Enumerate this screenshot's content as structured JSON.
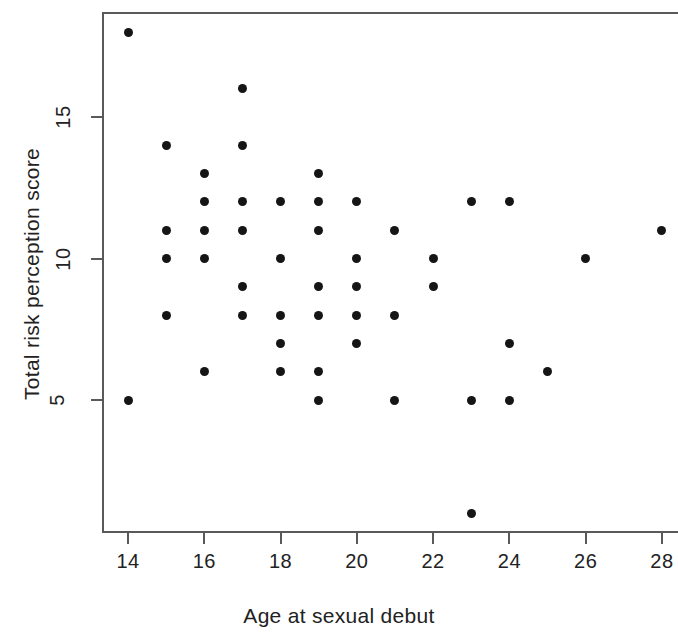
{
  "chart_data": {
    "type": "scatter",
    "title": "",
    "xlabel": "Age at sexual debut",
    "ylabel": "Total risk perception score",
    "xticks": [
      14,
      16,
      18,
      20,
      22,
      24,
      26,
      28
    ],
    "yticks": [
      5,
      10,
      15
    ],
    "xlim": [
      13.3,
      28.4
    ],
    "ylim": [
      0.4,
      18.9
    ],
    "grid": false,
    "legend": null,
    "marker": {
      "shape": "circle",
      "color": "#151515",
      "size": 9
    },
    "points": [
      {
        "x": 14,
        "y": 18
      },
      {
        "x": 14,
        "y": 5
      },
      {
        "x": 15,
        "y": 14
      },
      {
        "x": 15,
        "y": 11
      },
      {
        "x": 15,
        "y": 10
      },
      {
        "x": 15,
        "y": 8
      },
      {
        "x": 16,
        "y": 13
      },
      {
        "x": 16,
        "y": 12
      },
      {
        "x": 16,
        "y": 11
      },
      {
        "x": 16,
        "y": 10
      },
      {
        "x": 16,
        "y": 6
      },
      {
        "x": 17,
        "y": 16
      },
      {
        "x": 17,
        "y": 14
      },
      {
        "x": 17,
        "y": 12
      },
      {
        "x": 17,
        "y": 11
      },
      {
        "x": 17,
        "y": 9
      },
      {
        "x": 17,
        "y": 8
      },
      {
        "x": 18,
        "y": 12
      },
      {
        "x": 18,
        "y": 10
      },
      {
        "x": 18,
        "y": 8
      },
      {
        "x": 18,
        "y": 7
      },
      {
        "x": 18,
        "y": 6
      },
      {
        "x": 19,
        "y": 13
      },
      {
        "x": 19,
        "y": 12
      },
      {
        "x": 19,
        "y": 11
      },
      {
        "x": 19,
        "y": 9
      },
      {
        "x": 19,
        "y": 8
      },
      {
        "x": 19,
        "y": 6
      },
      {
        "x": 19,
        "y": 5
      },
      {
        "x": 20,
        "y": 12
      },
      {
        "x": 20,
        "y": 10
      },
      {
        "x": 20,
        "y": 9
      },
      {
        "x": 20,
        "y": 8
      },
      {
        "x": 20,
        "y": 7
      },
      {
        "x": 21,
        "y": 11
      },
      {
        "x": 21,
        "y": 8
      },
      {
        "x": 21,
        "y": 5
      },
      {
        "x": 22,
        "y": 10
      },
      {
        "x": 22,
        "y": 9
      },
      {
        "x": 23,
        "y": 12
      },
      {
        "x": 23,
        "y": 5
      },
      {
        "x": 23,
        "y": 1
      },
      {
        "x": 24,
        "y": 12
      },
      {
        "x": 24,
        "y": 7
      },
      {
        "x": 24,
        "y": 5
      },
      {
        "x": 25,
        "y": 6
      },
      {
        "x": 26,
        "y": 10
      },
      {
        "x": 28,
        "y": 11
      }
    ]
  },
  "axes": {
    "x_tick_labels": [
      "14",
      "16",
      "18",
      "20",
      "22",
      "24",
      "26",
      "28"
    ],
    "y_tick_labels": [
      "5",
      "10",
      "15"
    ],
    "x_axis_title": "Age at sexual debut",
    "y_axis_title": "Total risk perception score"
  },
  "colors": {
    "point": "#151515",
    "axis": "#595959",
    "text": "#222222",
    "background": "#ffffff"
  }
}
